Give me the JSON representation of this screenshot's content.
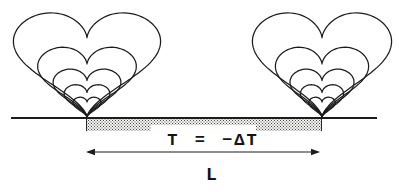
{
  "labels": {
    "temperature": "T = −ΔT",
    "length": "L"
  },
  "colors": {
    "ink": "#1c1c1c",
    "background": "#ffffff",
    "stipple_dot": "#4a4a4a",
    "stipple_bg": "#f3f3f0"
  },
  "diagram": {
    "canvas": {
      "width": 399,
      "height": 192
    },
    "surface_line": {
      "x1": 11,
      "x2": 377,
      "y": 118,
      "thickness": 2
    },
    "cooled_strip": {
      "x": 86,
      "y": 119,
      "width": 236,
      "height": 12,
      "light_patch": {
        "x_offset": 64,
        "width": 105,
        "height": 6
      }
    },
    "contour_groups": [
      {
        "name": "left-vortex-contours",
        "tip_x": 87,
        "tip_y": 117,
        "sx": 4.6,
        "sy": 3.6
      },
      {
        "name": "right-vortex-contours",
        "tip_x": 322,
        "tip_y": 117,
        "sx": 4.35,
        "sy": 3.6
      }
    ],
    "contour_scales": [
      1,
      0.67,
      0.46,
      0.31,
      0.19
    ],
    "span_arrow": {
      "x1": 86,
      "x2": 320,
      "y": 152,
      "head_length": 9,
      "head_halfwidth": 3.2
    },
    "labels_pos": {
      "temperature": {
        "cx": 213,
        "cy": 140
      },
      "length": {
        "cx": 212,
        "cy": 175
      }
    }
  }
}
